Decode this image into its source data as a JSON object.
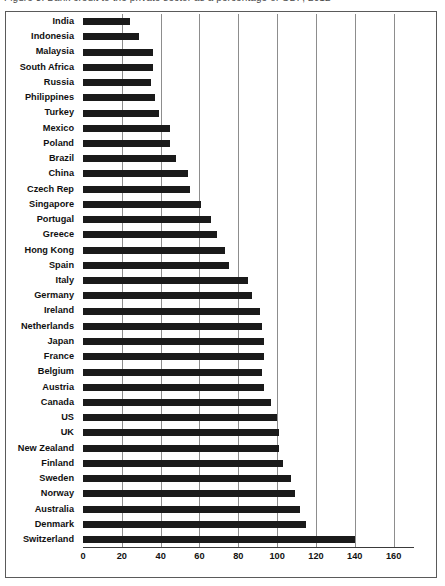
{
  "title": {
    "text": "Figure 3: Bank credit to the private sector as a percentage of GDP, 2012"
  },
  "chart": {
    "frame_color": "#5a5a5a",
    "bar_color": "#1a1a1a",
    "grid_color": "#8d8d8d",
    "grid_on": true,
    "legend": "none"
  },
  "chart_data": {
    "type": "bar",
    "orientation": "horizontal",
    "title": "",
    "xlabel": "",
    "ylabel": "",
    "xlim": [
      0,
      170
    ],
    "xticks": [
      0,
      20,
      40,
      60,
      80,
      100,
      120,
      140,
      160
    ],
    "grid": true,
    "legend_position": "none",
    "categories": [
      "India",
      "Indonesia",
      "Malaysia",
      "South Africa",
      "Russia",
      "Philippines",
      "Turkey",
      "Mexico",
      "Poland",
      "Brazil",
      "China",
      "Czech Rep",
      "Singapore",
      "Portugal",
      "Greece",
      "Hong Kong",
      "Spain",
      "Italy",
      "Germany",
      "Ireland",
      "Netherlands",
      "Japan",
      "France",
      "Belgium",
      "Austria",
      "Canada",
      "US",
      "UK",
      "New Zealand",
      "Finland",
      "Sweden",
      "Norway",
      "Australia",
      "Denmark",
      "Switzerland"
    ],
    "values": [
      24,
      29,
      36,
      36,
      35,
      37,
      39,
      45,
      45,
      48,
      54,
      55,
      61,
      66,
      69,
      73,
      75,
      85,
      87,
      91,
      92,
      93,
      93,
      92,
      93,
      97,
      100,
      101,
      101,
      103,
      107,
      109,
      112,
      115,
      140
    ]
  }
}
